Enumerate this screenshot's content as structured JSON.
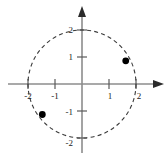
{
  "figure": {
    "title": "",
    "background_color": "#ffffff",
    "axis_color": "#8c8c8c",
    "curve_color": "#3a3a3a",
    "point_color": "#000000"
  },
  "chart_data": {
    "type": "scatter",
    "title": "",
    "xlabel": "",
    "ylabel": "",
    "xlim": [
      -2.7,
      2.8
    ],
    "ylim": [
      -2.75,
      2.75
    ],
    "grid": false,
    "legend": null,
    "x_ticks": [
      -2,
      -1,
      1,
      2
    ],
    "y_ticks": [
      -2,
      -1,
      1,
      2
    ],
    "x_tick_labels": [
      "-2",
      "-1",
      "1",
      "2"
    ],
    "y_tick_labels": [
      "-2",
      "-1",
      "1",
      "2"
    ],
    "annotations": [],
    "series": [
      {
        "name": "circle",
        "type": "curve",
        "style": "dashed",
        "shape": "circle",
        "center": [
          0,
          0
        ],
        "radius": 2
      },
      {
        "name": "marked-points",
        "type": "scatter",
        "marker": "filled-circle",
        "points": [
          {
            "label": "point-1",
            "x": 1.62,
            "y": 0.86
          },
          {
            "label": "point-2",
            "x": -1.47,
            "y": -1.13
          }
        ]
      }
    ]
  },
  "axes": {
    "x_axis_name": "x-axis",
    "y_axis_name": "y-axis",
    "x_arrow": "right",
    "y_arrow": "up"
  }
}
